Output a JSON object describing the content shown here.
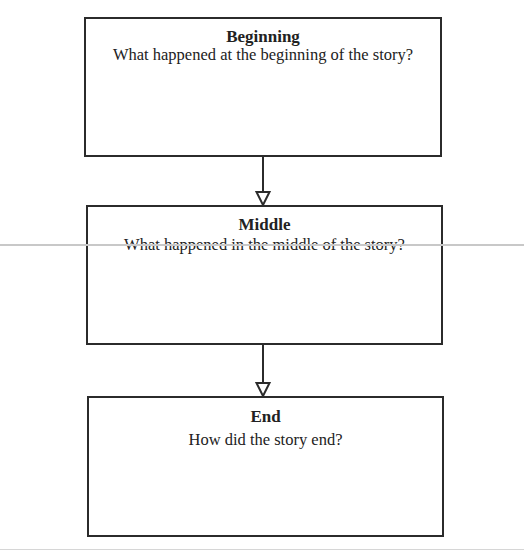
{
  "diagram": {
    "type": "flowchart",
    "direction": "top-to-bottom",
    "boxes": [
      {
        "id": "beginning",
        "title": "Beginning",
        "question": "What happened at the beginning of the story?"
      },
      {
        "id": "middle",
        "title": "Middle",
        "question": "What happened in the middle of the story?"
      },
      {
        "id": "end",
        "title": "End",
        "question": "How did the story end?"
      }
    ],
    "edges": [
      {
        "from": "beginning",
        "to": "middle",
        "style": "open-triangle-arrow"
      },
      {
        "from": "middle",
        "to": "end",
        "style": "open-triangle-arrow"
      }
    ]
  },
  "colors": {
    "border": "#2b2b2b",
    "background": "#ffffff",
    "page_rule": "#c8c8c8"
  }
}
